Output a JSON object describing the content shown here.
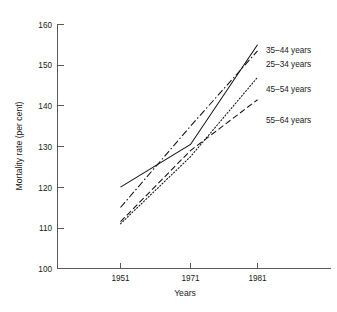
{
  "chart_data": {
    "type": "line",
    "title": "",
    "subtitle": "",
    "xlabel": "Years",
    "ylabel": "Mortality rate (per cent)",
    "x": [
      1951,
      1971,
      1981
    ],
    "xtick_labels": [
      "1951",
      "1971",
      "1981"
    ],
    "ytick_labels": [
      "100",
      "110",
      "120",
      "130",
      "140",
      "150",
      "160"
    ],
    "ytick_values": [
      100,
      110,
      120,
      130,
      140,
      150,
      160
    ],
    "ylim": [
      100,
      160
    ],
    "xlim": [
      1945,
      1990
    ],
    "grid": false,
    "legend_position": "right-inline-labels",
    "series": [
      {
        "name": "35–44 years",
        "label": "35–44 years",
        "style": "solid",
        "dash": "none",
        "color": "#111111",
        "values": [
          120,
          130.5,
          155
        ],
        "label_y": 153.5
      },
      {
        "name": "25–34 years",
        "label": "25–34 years",
        "style": "dash-dot",
        "dash": "7,2.5,1.5,2.5",
        "color": "#111111",
        "values": [
          115,
          135,
          153.5
        ],
        "label_y": 150.2
      },
      {
        "name": "45–54 years",
        "label": "45–54 years",
        "style": "dotted",
        "dash": "1.2,2.0",
        "color": "#111111",
        "values": [
          111,
          127.5,
          147
        ],
        "label_y": 144.0
      },
      {
        "name": "55–64 years",
        "label": "55–64 years",
        "style": "long-dash",
        "dash": "6,3",
        "color": "#111111",
        "values": [
          111.5,
          129,
          141.5
        ],
        "label_y": 136.3
      }
    ]
  },
  "axes": {
    "y_axis_name": "mortality-rate-axis",
    "x_axis_name": "years-axis"
  }
}
